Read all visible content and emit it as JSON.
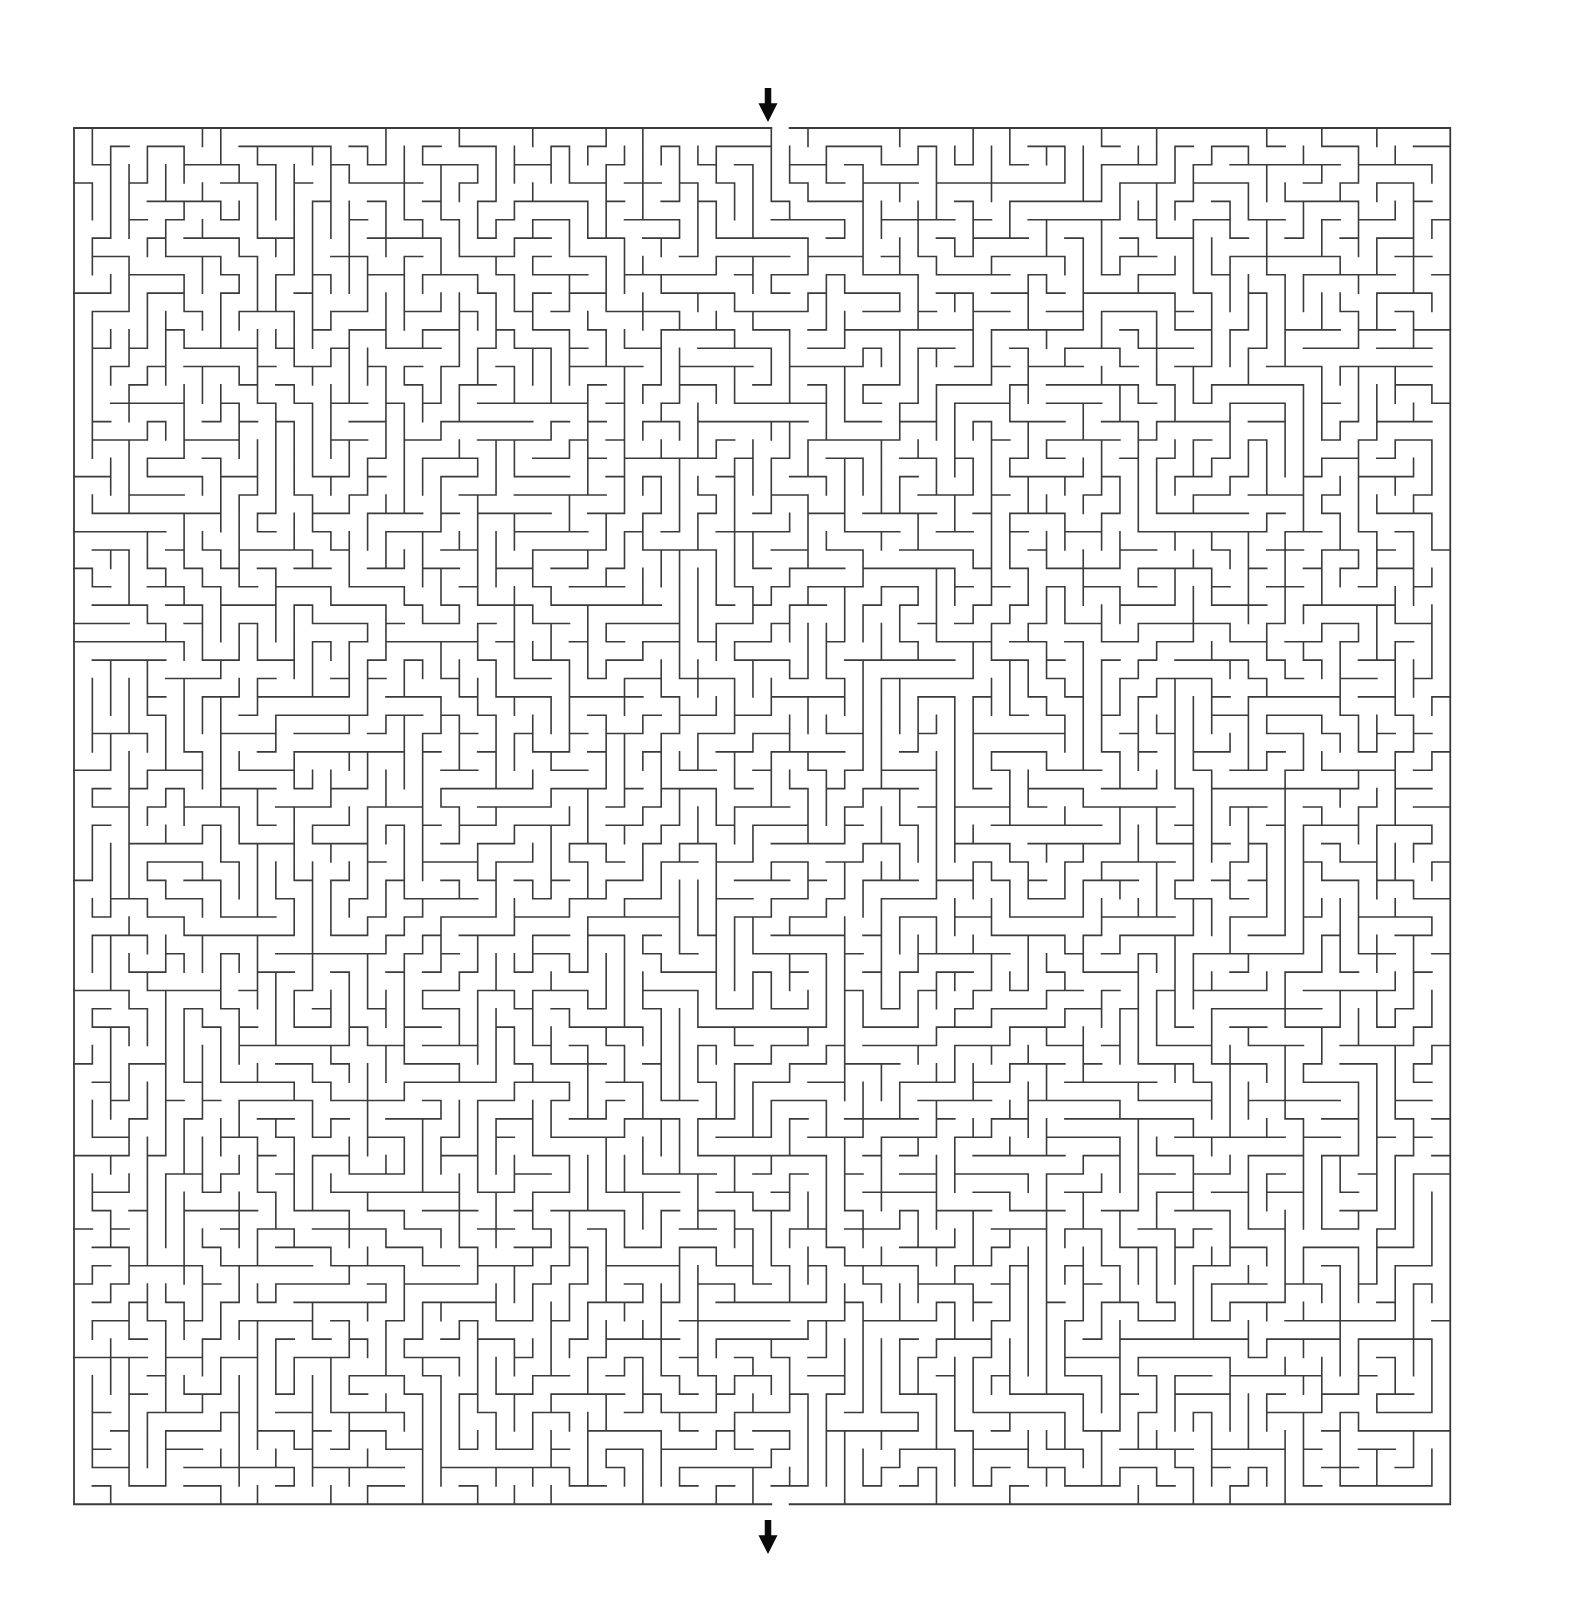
{
  "page": {
    "title": "Maze Puzzle",
    "background_color": "#ffffff",
    "width": 1572,
    "height": 1615
  },
  "maze": {
    "type": "perfect-maze",
    "label": "Square grid maze",
    "columns": 75,
    "rows": 75,
    "cell_size": 18.35,
    "origin_x": 74,
    "origin_y": 128,
    "wall_color": "#3b3b3b",
    "wall_thickness": 1.6,
    "border_thickness": 1.8,
    "background_color": "#ffffff",
    "seed": 20240517,
    "entrance": {
      "name": "entrance",
      "side": "top",
      "column": 38,
      "arrow_direction": "down",
      "arrow_color": "#0a0a0a",
      "arrow_center_x": 768,
      "arrow_top_y": 88,
      "arrow_bottom_y": 122
    },
    "exit": {
      "name": "exit",
      "side": "bottom",
      "column": 38,
      "arrow_direction": "down",
      "arrow_color": "#0a0a0a",
      "arrow_center_x": 768,
      "arrow_top_y": 1520,
      "arrow_bottom_y": 1554
    }
  }
}
